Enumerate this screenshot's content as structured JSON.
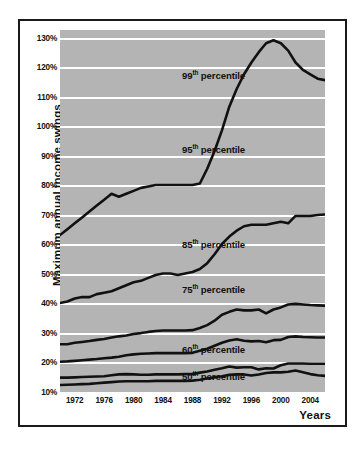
{
  "chart_data": {
    "type": "line",
    "title": "",
    "xlabel": "Years",
    "ylabel": "Maximum annual income swings",
    "grid": true,
    "legend_position": "inline-annotations",
    "xlim": [
      1970,
      2006
    ],
    "ylim": [
      10,
      133
    ],
    "xticks": [
      1972,
      1976,
      1980,
      1984,
      1988,
      1992,
      1996,
      2000,
      2004
    ],
    "xtick_labels": [
      "1972",
      "1976",
      "1980",
      "1984",
      "1988",
      "1992",
      "1996",
      "2000",
      "2004"
    ],
    "yticks": [
      130,
      120,
      110,
      100,
      90,
      80,
      70,
      60,
      50,
      40,
      30,
      20,
      10
    ],
    "ytick_labels": [
      "130%",
      "120%",
      "110%",
      "100%",
      "90%",
      "80%",
      "70%",
      "60%",
      "50%",
      "40%",
      "30%",
      "20%",
      "10%"
    ],
    "x": [
      1970,
      1971,
      1972,
      1973,
      1974,
      1975,
      1976,
      1977,
      1978,
      1979,
      1980,
      1981,
      1982,
      1983,
      1984,
      1985,
      1986,
      1987,
      1988,
      1989,
      1990,
      1991,
      1992,
      1993,
      1994,
      1995,
      1996,
      1997,
      1998,
      1999,
      2000,
      2001,
      2002,
      2003,
      2004,
      2005,
      2006
    ],
    "series": [
      {
        "name": "99th percentile",
        "label": "99",
        "suffix": "th",
        "label_text": "percentile",
        "color": "#111111",
        "values": [
          63.5,
          65.5,
          67.5,
          69.5,
          71.5,
          73.5,
          75.5,
          77.5,
          76.5,
          77.5,
          78.5,
          79.5,
          80.0,
          80.5,
          80.5,
          80.5,
          80.5,
          80.5,
          80.5,
          81.0,
          86.0,
          92.0,
          99.0,
          107.0,
          113.0,
          118.0,
          122.0,
          125.5,
          128.5,
          129.5,
          128.5,
          126.0,
          122.0,
          119.5,
          118.0,
          116.5,
          116.0
        ]
      },
      {
        "name": "95th percentile",
        "label": "95",
        "suffix": "th",
        "label_text": "percentile",
        "color": "#111111",
        "values": [
          40.5,
          41.0,
          42.0,
          42.5,
          42.5,
          43.5,
          44.0,
          44.5,
          45.5,
          46.5,
          47.5,
          48.0,
          49.0,
          50.0,
          50.5,
          50.5,
          50.0,
          50.5,
          51.0,
          52.0,
          54.0,
          57.0,
          60.5,
          63.0,
          65.0,
          66.5,
          67.0,
          67.0,
          67.0,
          67.5,
          68.0,
          67.5,
          70.0,
          70.0,
          70.0,
          70.3,
          70.5
        ]
      },
      {
        "name": "85th percentile",
        "label": "85",
        "suffix": "th",
        "label_text": "percentile",
        "color": "#111111",
        "values": [
          26.5,
          26.5,
          27.0,
          27.3,
          27.6,
          28.0,
          28.3,
          28.8,
          29.2,
          29.5,
          30.0,
          30.3,
          30.7,
          31.0,
          31.2,
          31.2,
          31.2,
          31.2,
          31.3,
          32.0,
          33.0,
          34.5,
          36.5,
          37.5,
          38.3,
          38.0,
          38.0,
          38.3,
          37.0,
          38.3,
          39.0,
          40.0,
          40.2,
          40.0,
          39.8,
          39.7,
          39.6
        ]
      },
      {
        "name": "75th percentile",
        "label": "75",
        "suffix": "th",
        "label_text": "percentile",
        "color": "#111111",
        "values": [
          20.6,
          20.7,
          20.9,
          21.1,
          21.3,
          21.5,
          21.8,
          22.0,
          22.3,
          22.8,
          23.1,
          23.3,
          23.4,
          23.5,
          23.5,
          23.5,
          23.5,
          23.5,
          23.6,
          24.3,
          25.0,
          26.0,
          27.0,
          27.8,
          28.2,
          27.7,
          27.5,
          27.6,
          27.2,
          27.9,
          28.0,
          29.0,
          29.2,
          29.0,
          28.9,
          28.8,
          28.8
        ]
      },
      {
        "name": "60th percentile",
        "label": "60",
        "suffix": "th",
        "label_text": "percentile",
        "color": "#111111",
        "values": [
          15.2,
          15.2,
          15.3,
          15.4,
          15.5,
          15.6,
          15.7,
          16.0,
          16.3,
          16.4,
          16.3,
          16.2,
          16.2,
          16.3,
          16.3,
          16.3,
          16.3,
          16.4,
          16.4,
          16.9,
          17.3,
          17.9,
          18.4,
          19.0,
          18.6,
          18.7,
          18.7,
          18.0,
          18.4,
          18.3,
          19.4,
          20.0,
          20.0,
          20.0,
          19.9,
          19.9,
          19.9
        ]
      },
      {
        "name": "50th percentile",
        "label": "50",
        "suffix": "th",
        "label_text": "percentile",
        "color": "#111111",
        "values": [
          12.7,
          12.8,
          12.9,
          13.0,
          13.1,
          13.3,
          13.5,
          13.7,
          13.9,
          14.0,
          14.0,
          14.0,
          14.0,
          14.1,
          14.1,
          14.1,
          14.1,
          14.1,
          14.2,
          14.5,
          14.9,
          15.3,
          15.7,
          16.2,
          16.3,
          16.3,
          15.9,
          16.3,
          16.8,
          17.0,
          17.0,
          17.2,
          17.6,
          17.0,
          16.4,
          16.0,
          15.8
        ]
      }
    ]
  },
  "axis": {
    "ylabel": "Maximum annual income swings",
    "xlabel": "Years"
  },
  "colors": {
    "plot_background": "#b4b4b4",
    "gridline": "#ffffff",
    "line": "#111111",
    "frame": "#1a1a1a",
    "page_background": "#ffffff"
  },
  "annotations": [
    {
      "id": "ann-99",
      "number": "99",
      "ordinal": "th",
      "text": "percentile",
      "x_pct": 46.0,
      "y_pct": 11.0
    },
    {
      "id": "ann-95",
      "number": "95",
      "ordinal": "th",
      "text": "percentile",
      "x_pct": 46.0,
      "y_pct": 31.5
    },
    {
      "id": "ann-85",
      "number": "85",
      "ordinal": "th",
      "text": "percentile",
      "x_pct": 46.0,
      "y_pct": 57.5
    },
    {
      "id": "ann-75",
      "number": "75",
      "ordinal": "th",
      "text": "percentile",
      "x_pct": 46.0,
      "y_pct": 70.0
    },
    {
      "id": "ann-60",
      "number": "60",
      "ordinal": "th",
      "text": "percentile",
      "x_pct": 46.0,
      "y_pct": 86.5
    },
    {
      "id": "ann-50",
      "number": "50",
      "ordinal": "th",
      "text": "percentile",
      "x_pct": 46.0,
      "y_pct": 94.0
    }
  ]
}
